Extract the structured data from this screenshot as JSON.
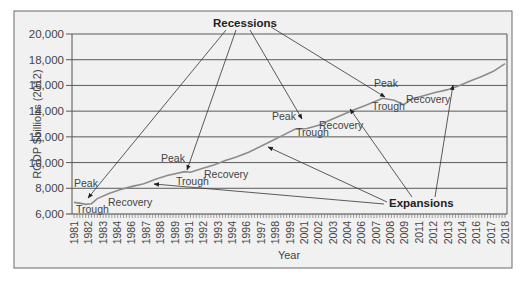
{
  "chart_data": {
    "type": "line",
    "title": "",
    "xlabel": "Year",
    "ylabel": "RGDP $billions (2012)",
    "ylim": [
      6000,
      20000
    ],
    "xlim": [
      1981,
      2018
    ],
    "grid": true,
    "y_ticks": [
      "6,000",
      "8,000",
      "10,000",
      "12,000",
      "14,000",
      "16,000",
      "18,000",
      "20,000"
    ],
    "y_tick_values": [
      6000,
      8000,
      10000,
      12000,
      14000,
      16000,
      18000,
      20000
    ],
    "x_tick_labels": [
      "1981",
      "1982",
      "1983",
      "1984",
      "1986",
      "1987",
      "1988",
      "1989",
      "1991",
      "1992",
      "1993",
      "1994",
      "1996",
      "1997",
      "1998",
      "1999",
      "2001",
      "2002",
      "2003",
      "2004",
      "2006",
      "2007",
      "2008",
      "2009",
      "2011",
      "2012",
      "2013",
      "2014",
      "2016",
      "2017",
      "2018"
    ],
    "series": [
      {
        "name": "RGDP",
        "x": [
          1981,
          1981.5,
          1982,
          1982.5,
          1983,
          1984,
          1985,
          1986,
          1987,
          1988,
          1989,
          1990.5,
          1991,
          1992,
          1993,
          1994,
          1995,
          1996,
          1997,
          1998,
          1999,
          2000,
          2001,
          2002,
          2003,
          2004,
          2005,
          2006,
          2007.5,
          2008.5,
          2009.3,
          2010,
          2011,
          2012,
          2013,
          2014,
          2015,
          2016,
          2017,
          2018
        ],
        "values": [
          6900,
          6850,
          6750,
          6800,
          7200,
          7600,
          7900,
          8150,
          8350,
          8700,
          9000,
          9300,
          9250,
          9550,
          9800,
          10150,
          10450,
          10800,
          11250,
          11700,
          12150,
          12600,
          12650,
          12900,
          13300,
          13700,
          14100,
          14450,
          15000,
          14850,
          14500,
          14950,
          15200,
          15450,
          15650,
          15950,
          16350,
          16700,
          17100,
          17700
        ]
      }
    ],
    "annotations": {
      "callouts": [
        "Recessions",
        "Expansions"
      ],
      "labels": [
        {
          "text": "Peak",
          "year": 1981
        },
        {
          "text": "Trough",
          "year": 1982
        },
        {
          "text": "Recovery",
          "year": 1983
        },
        {
          "text": "Peak",
          "year": 1990
        },
        {
          "text": "Trough",
          "year": 1991
        },
        {
          "text": "Recovery",
          "year": 1992
        },
        {
          "text": "Peak",
          "year": 2001
        },
        {
          "text": "Trough",
          "year": 2001
        },
        {
          "text": "Recovery",
          "year": 2002
        },
        {
          "text": "Peak",
          "year": 2007
        },
        {
          "text": "Trough",
          "year": 2009
        },
        {
          "text": "Recovery",
          "year": 2010
        }
      ]
    },
    "legend": null
  },
  "colors": {
    "line": "#8c8c8c",
    "grid": "#5a5a5a",
    "frame_bg": "#f1f1f1",
    "frame_border": "#6a6a6a",
    "text": "#444444"
  },
  "text": {
    "recessions": "Recessions",
    "expansions": "Expansions",
    "ylabel": "RGDP $billions (2012)",
    "xlabel": "Year",
    "peak": "Peak",
    "trough": "Trough",
    "recovery": "Recovery"
  }
}
